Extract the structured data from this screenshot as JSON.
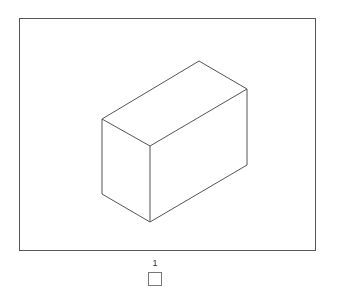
{
  "canvas": {
    "figure": "box",
    "stroke_color": "#555555",
    "vertices": {
      "top": [
        199,
        61
      ],
      "left_top": [
        102,
        119
      ],
      "right_top": [
        247,
        89
      ],
      "front_top": [
        150,
        146
      ],
      "left_bottom": [
        102,
        194
      ],
      "front_bottom": [
        150,
        222
      ],
      "right_bottom": [
        247,
        165
      ]
    }
  },
  "pager": {
    "current_page_label": "1"
  }
}
